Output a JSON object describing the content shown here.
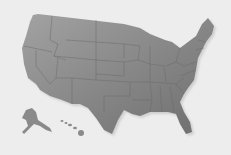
{
  "map": {
    "title": "",
    "colors": {
      "background": "#ededed",
      "land_light": "#9a9a9a",
      "land_dark": "#707070",
      "border": "#6a6a6a",
      "shadow": "#d4d4d4"
    },
    "regions": [
      "contiguous-us",
      "alaska",
      "hawaii"
    ]
  }
}
